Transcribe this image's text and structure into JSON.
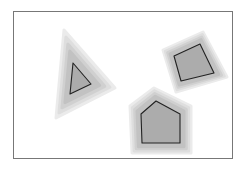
{
  "diagram": {
    "colors": {
      "background": "#ffffff",
      "frame": "#777777",
      "fill": "#acacac",
      "outline": "#222222",
      "halo_levels": [
        "#ebebeb",
        "#dedede",
        "#d0d0d0",
        "#c2c2c2"
      ]
    },
    "frame": {
      "x": 13,
      "y": 11,
      "width": 219,
      "height": 147
    },
    "shapes": [
      {
        "name": "triangle",
        "points": [
          [
            73,
            63
          ],
          [
            70,
            94
          ],
          [
            91,
            84
          ]
        ],
        "halo": [
          [
            64,
            30
          ],
          [
            56,
            118
          ],
          [
            115,
            88
          ]
        ]
      },
      {
        "name": "quadrilateral",
        "points": [
          [
            174,
            56
          ],
          [
            200,
            44
          ],
          [
            214,
            73
          ],
          [
            181,
            81
          ]
        ],
        "halo": [
          [
            163,
            50
          ],
          [
            203,
            32
          ],
          [
            227,
            77
          ],
          [
            176,
            92
          ]
        ]
      },
      {
        "name": "pentagon",
        "points": [
          [
            141,
            114
          ],
          [
            156,
            101
          ],
          [
            180,
            114
          ],
          [
            180,
            143
          ],
          [
            142,
            143
          ]
        ],
        "halo": [
          [
            130,
            106
          ],
          [
            154,
            88
          ],
          [
            191,
            106
          ],
          [
            191,
            153
          ],
          [
            132,
            153
          ]
        ]
      }
    ]
  }
}
